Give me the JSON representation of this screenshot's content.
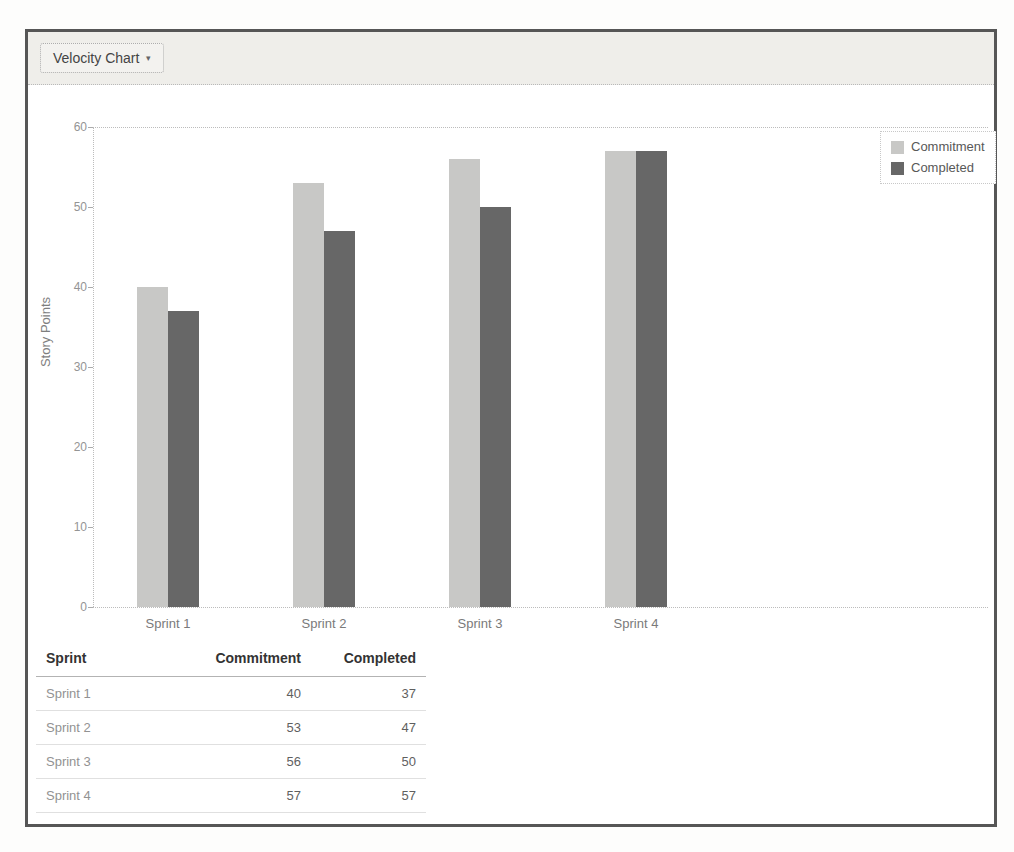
{
  "panel": {
    "selector": {
      "label": "Velocity Chart",
      "caret": "▾"
    }
  },
  "chart_data": {
    "type": "bar",
    "title": "",
    "categories": [
      "Sprint 1",
      "Sprint 2",
      "Sprint 3",
      "Sprint 4"
    ],
    "series": [
      {
        "name": "Commitment",
        "values": [
          40,
          53,
          56,
          57
        ],
        "color": "#c8c8c6"
      },
      {
        "name": "Completed",
        "values": [
          37,
          47,
          50,
          57
        ],
        "color": "#676767"
      }
    ],
    "xlabel": "",
    "ylabel": "Story Points",
    "ylim": [
      0,
      60
    ],
    "yticks": [
      0,
      10,
      20,
      30,
      40,
      50,
      60
    ],
    "grid": "dotted line at top (60) and baseline (0) only, dotted y-axis",
    "legend_position": "top-right"
  },
  "table": {
    "columns": [
      "Sprint",
      "Commitment",
      "Completed"
    ],
    "rows": [
      [
        "Sprint 1",
        "40",
        "37"
      ],
      [
        "Sprint 2",
        "53",
        "47"
      ],
      [
        "Sprint 3",
        "56",
        "50"
      ],
      [
        "Sprint 4",
        "57",
        "57"
      ]
    ]
  },
  "colors": {
    "panel_border": "#565656",
    "header_bg": "#efeeea",
    "dotted_line": "#bcbcbc",
    "commitment_bar": "#c8c8c6",
    "completed_bar": "#676767",
    "axis_text": "#949494",
    "table_header_text": "#333333",
    "table_row_text": "#5f5f5f"
  }
}
